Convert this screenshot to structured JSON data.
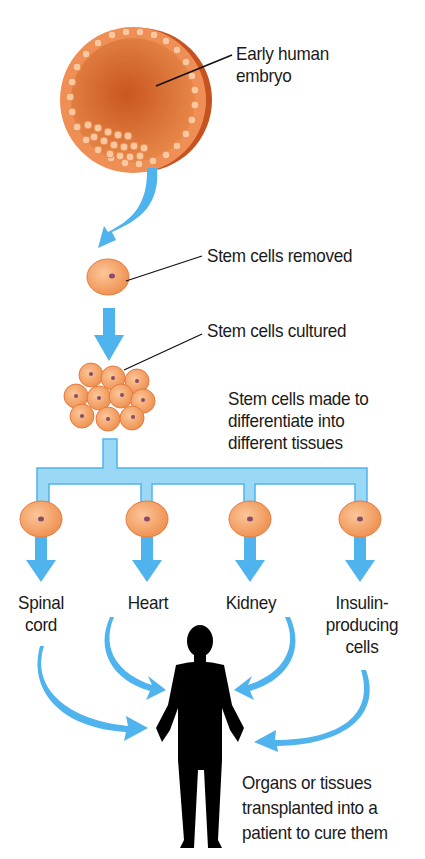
{
  "diagram": {
    "colors": {
      "arrow": "#4fb3ee",
      "arrow_light": "#9ad8f5",
      "cell_fill": "#f5a066",
      "cell_edge": "#e2763a",
      "nucleus": "#8a4a6a",
      "embryo": "#d86a30",
      "silhouette": "#000000"
    },
    "labels": {
      "embryo": [
        "Early human",
        "embryo"
      ],
      "removed": "Stem cells removed",
      "cultured": "Stem cells cultured",
      "differentiate": [
        "Stem cells made to",
        "differentiate into",
        "different tissues"
      ],
      "tissues": [
        {
          "line1": "Spinal",
          "line2": "cord"
        },
        {
          "line1": "Heart",
          "line2": ""
        },
        {
          "line1": "Kidney",
          "line2": ""
        },
        {
          "line1": "Insulin-",
          "line2": "producing",
          "line3": "cells"
        }
      ],
      "patient": [
        "Organs or tissues",
        "transplanted into a",
        "patient to cure them"
      ]
    },
    "steps": [
      "Early human embryo",
      "Stem cells removed",
      "Stem cells cultured",
      "Stem cells made to differentiate into different tissues",
      "Tissues: Spinal cord, Heart, Kidney, Insulin-producing cells",
      "Organs or tissues transplanted into a patient to cure them"
    ]
  }
}
